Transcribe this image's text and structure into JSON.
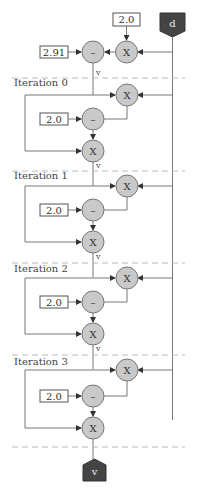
{
  "diagram": {
    "input_node": {
      "label": "d",
      "color": "#444444"
    },
    "output_node": {
      "label": "v",
      "color": "#444444"
    },
    "init": {
      "constant_mul": "2.0",
      "constant_sub": "2.91",
      "mul_op": "X",
      "sub_op": "–",
      "edge_label": "v"
    },
    "iterations": [
      {
        "label": "Iteration 0",
        "constant": "2.0",
        "mul_op_top": "X",
        "sub_op": "–",
        "mul_op_bottom": "X",
        "edge_label": "v"
      },
      {
        "label": "Iteration 1",
        "constant": "2.0",
        "mul_op_top": "X",
        "sub_op": "–",
        "mul_op_bottom": "X",
        "edge_label": "v"
      },
      {
        "label": "Iteration 2",
        "constant": "2.0",
        "mul_op_top": "X",
        "sub_op": "–",
        "mul_op_bottom": "X",
        "edge_label": "v"
      },
      {
        "label": "Iteration 3",
        "constant": "2.0",
        "mul_op_top": "X",
        "sub_op": "–",
        "mul_op_bottom": "X"
      }
    ],
    "colors": {
      "op_fill": "#c9c9c9",
      "terminal_fill": "#444444",
      "dashed_separator": "#bbbbbb"
    }
  }
}
